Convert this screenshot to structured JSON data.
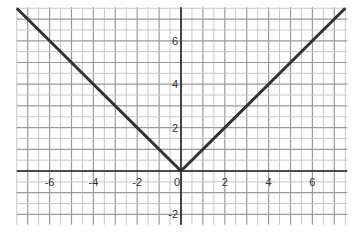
{
  "chart_data": {
    "type": "line",
    "title": "",
    "xlabel": "",
    "ylabel": "",
    "function": "y = |x|",
    "series": [
      {
        "name": "y = |x|",
        "x": [
          -7.5,
          -6,
          -4,
          -2,
          0,
          2,
          4,
          6,
          7.5
        ],
        "values": [
          7.5,
          6,
          4,
          2,
          0,
          2,
          4,
          6,
          7.5
        ]
      }
    ],
    "x_ticks": [
      -6,
      -4,
      -2,
      0,
      2,
      4,
      6
    ],
    "y_ticks": [
      -2,
      2,
      4,
      6
    ],
    "x_tick_labels": [
      "-6",
      "-4",
      "-2",
      "0",
      "2",
      "4",
      "6"
    ],
    "y_tick_labels": [
      "-2",
      "2",
      "4",
      "6"
    ],
    "xlim": [
      -7.5,
      7.5
    ],
    "ylim": [
      -2.2,
      7.5
    ],
    "grid": true,
    "grid_minor_step": 0.5,
    "grid_major_step": 1,
    "legend": "none",
    "colors": {
      "line": "#333333",
      "axis": "#222222",
      "grid_major": "#9a9a9a",
      "grid_minor": "#c8c8c8"
    }
  }
}
